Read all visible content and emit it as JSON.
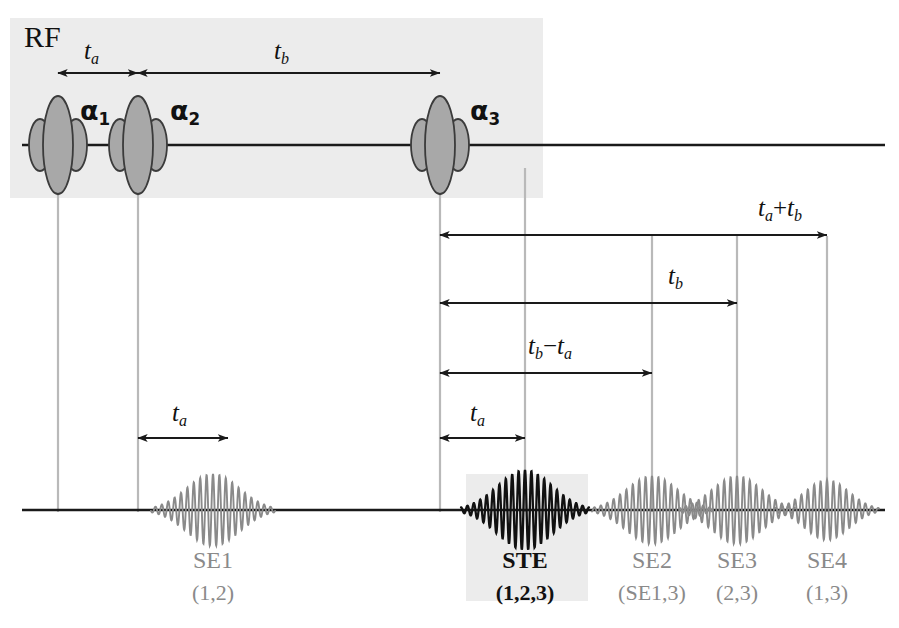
{
  "figure": {
    "kind": "mri-pulse-sequence-timing-diagram",
    "width": 899,
    "height": 628
  },
  "colors": {
    "background": "#ffffff",
    "panel_shade": "#ececec",
    "guide_line": "#b9b9b9",
    "axis_line": "#1a1a1a",
    "pulse_fill": "#a8a8a8",
    "pulse_stroke": "#3b3b3b",
    "echo_gray": "#8a8a8a",
    "echo_black": "#111111",
    "arrow": "#1a1a1a",
    "text": "#111111"
  },
  "rf_channel": {
    "axis_label": "RF",
    "pulses": [
      {
        "id": "alpha1",
        "label": "α",
        "subscript": "1",
        "x": 58
      },
      {
        "id": "alpha2",
        "label": "α",
        "subscript": "2",
        "x": 138
      },
      {
        "id": "alpha3",
        "label": "α",
        "subscript": "3",
        "x": 440
      }
    ],
    "intervals": [
      {
        "id": "rf-ta",
        "label": "t",
        "subscript": "a",
        "operator": "",
        "label2": "",
        "subscript2": "",
        "from_x": 58,
        "to_x": 138,
        "y": 73
      },
      {
        "id": "rf-tb",
        "label": "t",
        "subscript": "b",
        "operator": "",
        "label2": "",
        "subscript2": "",
        "from_x": 138,
        "to_x": 440,
        "y": 73
      }
    ]
  },
  "signal_channel": {
    "echoes": [
      {
        "id": "se1",
        "name": "SE1",
        "origin": "(1,2)",
        "x": 213,
        "emphasis": "normal"
      },
      {
        "id": "ste",
        "name": "STE",
        "origin": "(1,2,3)",
        "x": 525,
        "emphasis": "bold"
      },
      {
        "id": "se2",
        "name": "SE2",
        "origin": "(SE1,3)",
        "x": 652,
        "emphasis": "normal"
      },
      {
        "id": "se3",
        "name": "SE3",
        "origin": "(2,3)",
        "x": 737,
        "emphasis": "normal"
      },
      {
        "id": "se4",
        "name": "SE4",
        "origin": "(1,3)",
        "x": 827,
        "emphasis": "normal"
      }
    ]
  },
  "measurement_arrows": [
    {
      "id": "ta-plus-tb",
      "label": "t",
      "subscript": "a",
      "operator": "+",
      "label2": "t",
      "subscript2": "b",
      "from_x": 440,
      "to_x": 827,
      "y": 235,
      "text_x": 790,
      "text_y": 208
    },
    {
      "id": "tb-span",
      "label": "t",
      "subscript": "b",
      "operator": "",
      "label2": "",
      "subscript2": "",
      "from_x": 440,
      "to_x": 737,
      "y": 303,
      "text_x": 680,
      "text_y": 276
    },
    {
      "id": "tb-minus-ta",
      "label": "t",
      "subscript": "b",
      "operator": "−",
      "label2": "t",
      "subscript2": "a",
      "from_x": 440,
      "to_x": 652,
      "y": 373,
      "text_x": 568,
      "text_y": 346
    },
    {
      "id": "ste-ta",
      "label": "t",
      "subscript": "a",
      "operator": "",
      "label2": "",
      "subscript2": "",
      "from_x": 440,
      "to_x": 525,
      "y": 438,
      "text_x": 483,
      "text_y": 411
    },
    {
      "id": "se1-ta",
      "label": "t",
      "subscript": "a",
      "operator": "",
      "label2": "",
      "subscript2": "",
      "from_x": 138,
      "to_x": 228,
      "y": 438,
      "text_x": 183,
      "text_y": 411
    }
  ],
  "guide_lines": [
    {
      "id": "guide-alpha1",
      "x": 58,
      "top": 100,
      "bottom": 512
    },
    {
      "id": "guide-alpha2",
      "x": 138,
      "top": 100,
      "bottom": 512
    },
    {
      "id": "guide-alpha3",
      "x": 440,
      "top": 100,
      "bottom": 512
    },
    {
      "id": "guide-ste",
      "x": 525,
      "top": 168,
      "bottom": 512
    },
    {
      "id": "guide-se2",
      "x": 652,
      "top": 236,
      "bottom": 512
    },
    {
      "id": "guide-se3",
      "x": 737,
      "top": 236,
      "bottom": 512
    },
    {
      "id": "guide-se4",
      "x": 827,
      "top": 236,
      "bottom": 512
    }
  ],
  "highlight_boxes": [
    {
      "id": "rf-panel",
      "x": 10,
      "y": 18,
      "width": 533,
      "height": 180
    },
    {
      "id": "ste-panel",
      "x": 466,
      "y": 474,
      "width": 122,
      "height": 127
    }
  ]
}
